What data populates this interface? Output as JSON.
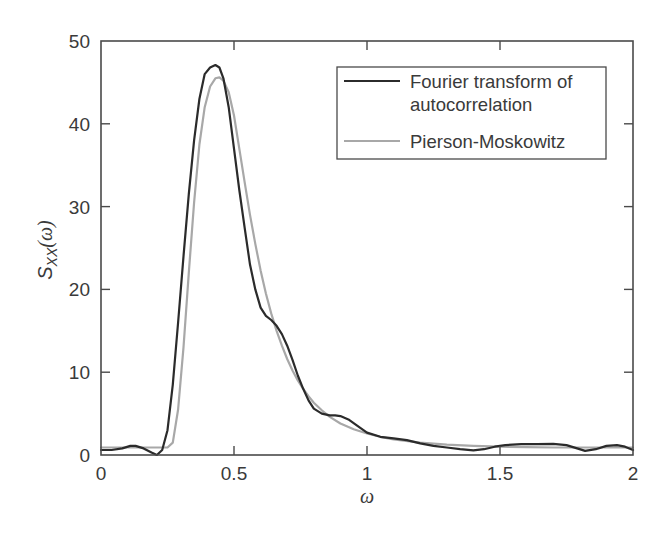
{
  "chart_data": {
    "type": "line",
    "title": "",
    "xlabel": "ω",
    "ylabel": "S_XX(ω)",
    "xlim": [
      0,
      2
    ],
    "ylim": [
      0,
      50
    ],
    "xticks": [
      0,
      0.5,
      1,
      1.5,
      2
    ],
    "xtick_labels": [
      "0",
      "0.5",
      "1",
      "1.5",
      "2"
    ],
    "yticks": [
      0,
      10,
      20,
      30,
      40,
      50
    ],
    "ytick_labels": [
      "0",
      "10",
      "20",
      "30",
      "40",
      "50"
    ],
    "grid": false,
    "legend_position": "upper right",
    "series": [
      {
        "name": "Fourier transform of autocorrelation",
        "color": "#2b2b2b",
        "width": 2.2,
        "x": [
          0,
          0.04,
          0.08,
          0.11,
          0.13,
          0.16,
          0.19,
          0.21,
          0.23,
          0.25,
          0.27,
          0.29,
          0.31,
          0.33,
          0.35,
          0.37,
          0.39,
          0.41,
          0.43,
          0.445,
          0.46,
          0.48,
          0.5,
          0.52,
          0.54,
          0.56,
          0.58,
          0.6,
          0.62,
          0.64,
          0.66,
          0.68,
          0.7,
          0.72,
          0.74,
          0.76,
          0.78,
          0.8,
          0.83,
          0.86,
          0.88,
          0.9,
          0.93,
          0.96,
          1.0,
          1.05,
          1.1,
          1.15,
          1.2,
          1.25,
          1.3,
          1.35,
          1.4,
          1.44,
          1.48,
          1.52,
          1.58,
          1.64,
          1.7,
          1.75,
          1.79,
          1.82,
          1.86,
          1.9,
          1.94,
          1.97,
          2.0
        ],
        "y": [
          0.6,
          0.6,
          0.8,
          1.1,
          1.1,
          0.8,
          0.3,
          0.0,
          0.6,
          3.0,
          8.5,
          16.0,
          24.0,
          31.5,
          38.0,
          43.0,
          46.0,
          46.8,
          47.1,
          46.8,
          45.5,
          42.0,
          37.0,
          32.0,
          27.5,
          23.0,
          20.0,
          17.8,
          16.8,
          16.3,
          15.6,
          14.6,
          13.2,
          11.5,
          9.6,
          8.0,
          6.6,
          5.6,
          5.0,
          4.8,
          4.8,
          4.7,
          4.3,
          3.6,
          2.7,
          2.2,
          2.0,
          1.8,
          1.4,
          1.1,
          0.9,
          0.7,
          0.55,
          0.7,
          1.0,
          1.2,
          1.3,
          1.3,
          1.35,
          1.2,
          0.8,
          0.5,
          0.7,
          1.1,
          1.2,
          1.0,
          0.6
        ]
      },
      {
        "name": "Pierson-Moskowitz",
        "color": "#a8a8a8",
        "width": 2.2,
        "x": [
          0,
          0.1,
          0.2,
          0.25,
          0.27,
          0.29,
          0.31,
          0.33,
          0.35,
          0.37,
          0.39,
          0.41,
          0.43,
          0.445,
          0.46,
          0.48,
          0.5,
          0.52,
          0.54,
          0.56,
          0.58,
          0.6,
          0.62,
          0.64,
          0.66,
          0.68,
          0.7,
          0.72,
          0.74,
          0.76,
          0.78,
          0.8,
          0.83,
          0.86,
          0.9,
          0.95,
          1.0,
          1.05,
          1.1,
          1.2,
          1.3,
          1.4,
          1.5,
          1.6,
          1.7,
          1.8,
          1.9,
          2.0
        ],
        "y": [
          0.9,
          0.9,
          0.9,
          0.9,
          1.5,
          5.5,
          13.0,
          22.0,
          30.5,
          37.5,
          42.0,
          44.5,
          45.5,
          45.6,
          45.2,
          43.8,
          41.0,
          37.0,
          33.0,
          29.0,
          25.5,
          22.3,
          19.5,
          17.1,
          15.0,
          13.2,
          11.6,
          10.2,
          9.0,
          8.0,
          7.1,
          6.3,
          5.4,
          4.6,
          3.8,
          3.1,
          2.6,
          2.2,
          1.9,
          1.5,
          1.25,
          1.1,
          1.0,
          0.95,
          0.9,
          0.9,
          0.9,
          0.9
        ]
      }
    ]
  },
  "legend": {
    "entries": [
      {
        "line1": "Fourier transform of",
        "line2": "autocorrelation",
        "color": "#2b2b2b"
      },
      {
        "line1": "Pierson-Moskowitz",
        "line2": "",
        "color": "#a8a8a8"
      }
    ]
  },
  "axes": {
    "xlabel": "ω",
    "ylabel_main": "S",
    "ylabel_sub": "XX",
    "ylabel_tail": "(ω)"
  }
}
